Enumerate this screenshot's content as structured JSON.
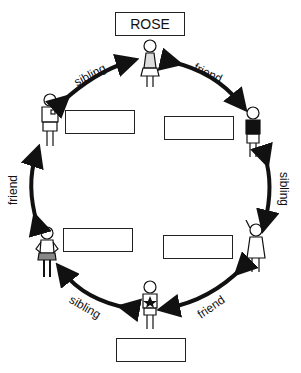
{
  "title_box": {
    "name": "ROSE"
  },
  "people": [
    {
      "id": "rose",
      "position": "top",
      "description": "girl in skirt"
    },
    {
      "id": "top-right",
      "position": "top-right",
      "description": "boy in dark shirt"
    },
    {
      "id": "bottom-right",
      "position": "bottom-right",
      "description": "girl waving"
    },
    {
      "id": "bottom",
      "position": "bottom",
      "description": "boy with star sweater"
    },
    {
      "id": "bottom-left",
      "position": "bottom-left",
      "description": "girl with hands on hips"
    },
    {
      "id": "top-left",
      "position": "top-left",
      "description": "boy with badge shirt"
    }
  ],
  "relations": [
    {
      "from": "rose",
      "to": "top-right",
      "label": "friend"
    },
    {
      "from": "top-right",
      "to": "bottom-right",
      "label": "sibling"
    },
    {
      "from": "bottom-right",
      "to": "bottom",
      "label": "friend"
    },
    {
      "from": "bottom",
      "to": "bottom-left",
      "label": "sibling"
    },
    {
      "from": "bottom-left",
      "to": "top-left",
      "label": "friend"
    },
    {
      "from": "top-left",
      "to": "rose",
      "label": "sibling"
    }
  ],
  "answer_boxes": [
    {
      "id": "top-left",
      "value": ""
    },
    {
      "id": "top-right",
      "value": ""
    },
    {
      "id": "bottom-left",
      "value": ""
    },
    {
      "id": "bottom-right",
      "value": ""
    },
    {
      "id": "bottom",
      "value": ""
    }
  ]
}
